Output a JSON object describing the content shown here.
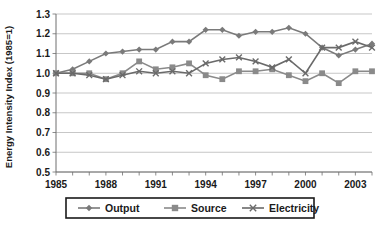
{
  "chart_data": {
    "type": "line",
    "title": "",
    "xlabel": "",
    "ylabel": "Energy Intensity Index (1985=1)",
    "xlim": [
      1985,
      2004
    ],
    "ylim": [
      0.5,
      1.3
    ],
    "ytick_values": [
      0.5,
      0.6,
      0.7,
      0.8,
      0.9,
      1.0,
      1.1,
      1.2,
      1.3
    ],
    "ytick_labels": [
      "0.5",
      "0.6",
      "0.7",
      "0.8",
      "0.9",
      "1.0",
      "1.1",
      "1.2",
      "1.3"
    ],
    "xtick_values": [
      1985,
      1988,
      1991,
      1994,
      1997,
      2000,
      2003
    ],
    "xtick_labels": [
      "1985",
      "1988",
      "1991",
      "1994",
      "1997",
      "2000",
      "2003"
    ],
    "x_minor_ticks": [
      1985,
      1986,
      1987,
      1988,
      1989,
      1990,
      1991,
      1992,
      1993,
      1994,
      1995,
      1996,
      1997,
      1998,
      1999,
      2000,
      2001,
      2002,
      2003,
      2004
    ],
    "grid": "horizontal",
    "legend_position": "bottom",
    "x": [
      1985,
      1986,
      1987,
      1988,
      1989,
      1990,
      1991,
      1992,
      1993,
      1994,
      1995,
      1996,
      1997,
      1998,
      1999,
      2000,
      2001,
      2002,
      2003,
      2004
    ],
    "series": [
      {
        "name": "Output",
        "marker": "diamond",
        "color": "#7a7a7a",
        "values": [
          1.0,
          1.02,
          1.06,
          1.1,
          1.11,
          1.12,
          1.12,
          1.16,
          1.16,
          1.22,
          1.22,
          1.19,
          1.21,
          1.21,
          1.23,
          1.2,
          1.13,
          1.09,
          1.12,
          1.15
        ]
      },
      {
        "name": "Source",
        "marker": "square",
        "color": "#8a8a8a",
        "values": [
          1.0,
          1.0,
          1.0,
          0.97,
          1.0,
          1.06,
          1.02,
          1.03,
          1.05,
          0.99,
          0.97,
          1.01,
          1.01,
          1.02,
          0.99,
          0.96,
          1.0,
          0.95,
          1.01,
          1.01
        ]
      },
      {
        "name": "Electricity",
        "marker": "x",
        "color": "#6a6a6a",
        "values": [
          1.0,
          1.0,
          0.99,
          0.97,
          0.99,
          1.01,
          1.0,
          1.01,
          1.0,
          1.05,
          1.07,
          1.08,
          1.06,
          1.03,
          1.07,
          1.0,
          1.13,
          1.13,
          1.16,
          1.13
        ]
      }
    ]
  },
  "legend": {
    "items": [
      {
        "label": "Output"
      },
      {
        "label": "Source"
      },
      {
        "label": "Electricity"
      }
    ]
  },
  "axis": {
    "y_title": "Energy Intensity Index (1985=1)"
  }
}
